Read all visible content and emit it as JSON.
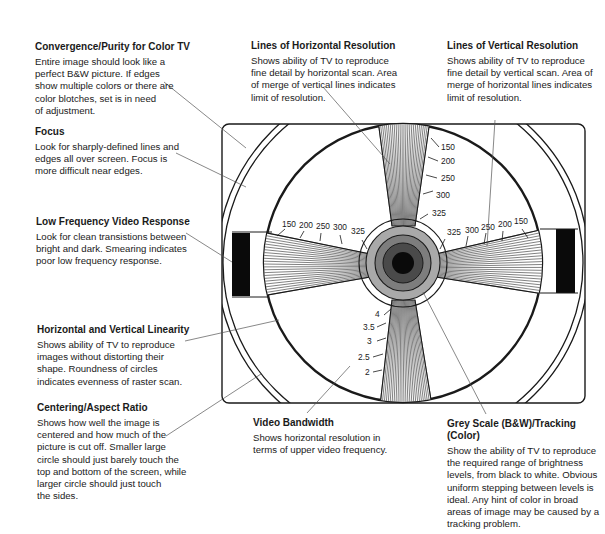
{
  "callouts": {
    "convergence": {
      "title": "Convergence/Purity for Color TV",
      "lines": [
        "Entire image should look like a",
        "perfect B&W picture. If edges",
        "show multiple colors or there are",
        "color blotches, set is in need",
        "of adjustment."
      ]
    },
    "focus": {
      "title": "Focus",
      "lines": [
        "Look for sharply-defined lines and",
        "edges all over screen. Focus is",
        "more difficult near edges."
      ]
    },
    "low_frequency": {
      "title": "Low Frequency Video Response",
      "lines": [
        "Look for clean transistions between",
        "bright and dark. Smearing indicates",
        "poor low frequency response."
      ]
    },
    "linearity": {
      "title": "Horizontal and Vertical Linearity",
      "lines": [
        "Shows ability of TV to reproduce",
        "images without distorting their",
        "shape. Roundness of circles",
        "indicates evenness of raster scan."
      ]
    },
    "centering": {
      "title": "Centering/Aspect Ratio",
      "lines": [
        "Shows how well the image is",
        "centered and how much of the",
        "picture is cut off. Smaller large",
        "circle should just barely touch the",
        "top and bottom of the screen, while",
        "larger circle should just touch",
        "the sides."
      ]
    },
    "horizontal_resolution": {
      "title": "Lines of Horizontal Resolution",
      "lines": [
        "Shows ability of TV to reproduce",
        "fine detail by horizontal scan. Area",
        "of merge of vertical lines indicates",
        "limit of resolution."
      ]
    },
    "vertical_resolution": {
      "title": "Lines of Vertical Resolution",
      "lines": [
        "Shows ability of TV to reproduce",
        "fine detail by vertical scan. Area of",
        "merge of horizontal lines indicates",
        "limit of resolution."
      ]
    },
    "video_bandwidth": {
      "title": "Video Bandwidth",
      "lines": [
        "Shows horizontal resolution in",
        "terms of upper video frequency."
      ]
    },
    "grey_scale": {
      "title_lines": [
        "Grey Scale (B&W)/Tracking",
        "(Color)"
      ],
      "lines": [
        "Show the ability of TV to reproduce",
        "the required range of brightness",
        "levels, from black to white. Obvious",
        "uniform stepping between levels is",
        "ideal. Any hint of color in broad",
        "areas of image may be caused by a",
        "tracking problem."
      ]
    }
  },
  "test_pattern": {
    "top_wedge_labels": [
      "150",
      "200",
      "250",
      "300",
      "325"
    ],
    "left_wedge_labels": [
      "150",
      "200",
      "250",
      "300",
      "325"
    ],
    "right_wedge_labels": [
      "325",
      "300",
      "250",
      "200",
      "150"
    ],
    "bottom_wedge_labels": [
      "4",
      "3.5",
      "3",
      "2.5",
      "2"
    ],
    "colors": {
      "line": "#1a1a1a",
      "grey_light": "#a9a9a9",
      "grey_mid": "#7d7d7d",
      "grey_dark": "#4a4a4a",
      "center": "#0a0a0a",
      "leader": "#555555"
    }
  }
}
